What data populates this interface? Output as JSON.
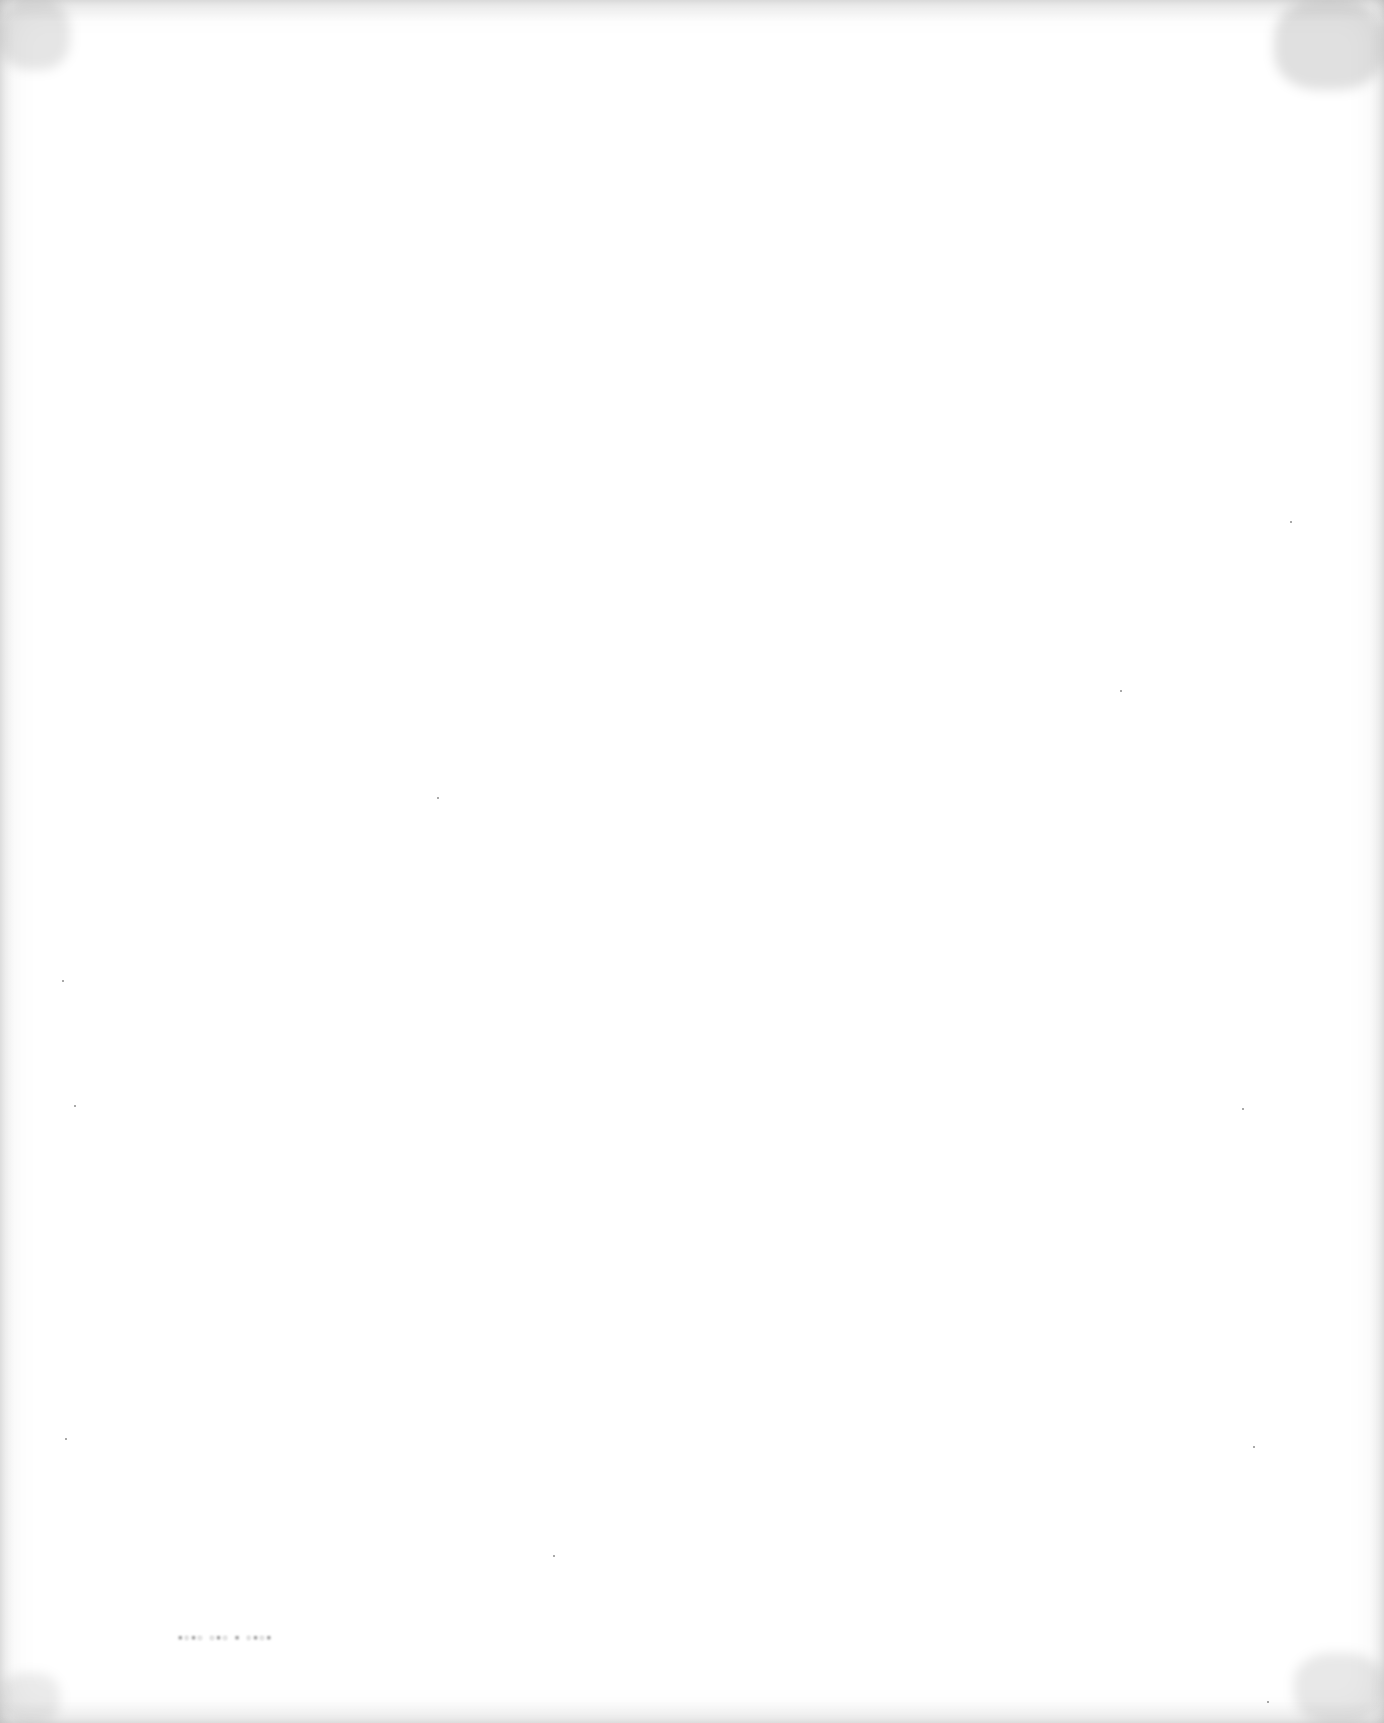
{
  "page": {
    "type": "blank scanned page",
    "background_color": "#ffffff",
    "edge_shading_color": "#d9d9d9"
  },
  "marks": {
    "bleed_through_text": "",
    "bleed_through_note": "illegible faint bleed-through marks near bottom-left"
  }
}
